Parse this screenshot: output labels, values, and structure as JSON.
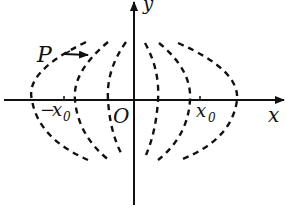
{
  "diagram": {
    "axes": {
      "x_label": "x",
      "y_label": "y",
      "origin_label": "O"
    },
    "ticks": {
      "neg_x0": {
        "minus": "−",
        "var": "x",
        "sub": "0"
      },
      "pos_x0": {
        "var": "x",
        "sub": "0"
      }
    },
    "point": {
      "label": "P",
      "arrow_direction": "right"
    },
    "curves": {
      "count": 6,
      "style": "dashed",
      "description": "nested dashed arcs, three opening left of the y-axis and three opening right"
    },
    "colors": {
      "ink": "#111111",
      "background": "#ffffff"
    }
  }
}
